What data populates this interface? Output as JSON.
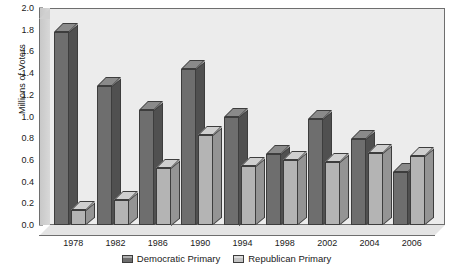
{
  "chart_data": {
    "type": "bar",
    "title": "",
    "subtitle": "",
    "xlabel": "",
    "ylabel": "Millions of Voters",
    "ylim": [
      0.0,
      2.0
    ],
    "ytick_step": 0.2,
    "ytick_labels": [
      "0.0",
      "0.2",
      "0.4",
      "0.6",
      "0.8",
      "1.0",
      "1.2",
      "1.4",
      "1.6",
      "1.8",
      "2.0"
    ],
    "ytick_values": [
      0.0,
      0.2,
      0.4,
      0.6,
      0.8,
      1.0,
      1.2,
      1.4,
      1.6,
      1.8,
      2.0
    ],
    "grid": false,
    "legend_position": "bottom-center",
    "style": "3d-bar",
    "categories": [
      "1978",
      "1982",
      "1986",
      "1990",
      "1994",
      "1998",
      "2002",
      "2004",
      "2006"
    ],
    "series": [
      {
        "name": "Democratic Primary",
        "color": "#6e6e6e",
        "values": [
          1.78,
          1.28,
          1.06,
          1.44,
          1.0,
          0.65,
          0.98,
          0.79,
          0.49
        ]
      },
      {
        "name": "Republican Primary",
        "color": "#b4b4b4",
        "values": [
          0.14,
          0.23,
          0.53,
          0.83,
          0.54,
          0.6,
          0.58,
          0.66,
          0.64
        ]
      }
    ]
  },
  "colors": {
    "plot_background": "#ececec",
    "wall": "#d0d0d0",
    "axis_line": "#6e6e6e",
    "text": "#1a1a1a",
    "democratic": "#6e6e6e",
    "republican": "#b4b4b4"
  }
}
